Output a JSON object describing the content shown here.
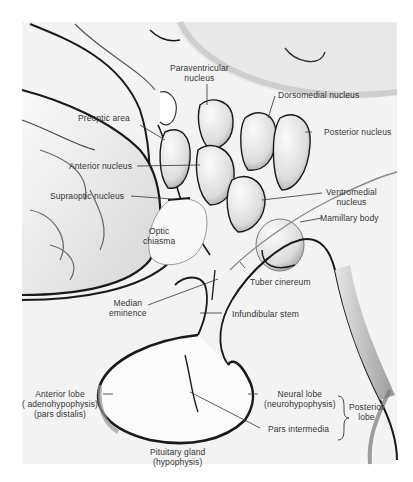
{
  "diagram": {
    "labels": {
      "paraventricular_1": "Paraventricular",
      "paraventricular_2": "nucleus",
      "dorsomedial": "Dorsomedial nucleus",
      "preoptic": "Preoptic area",
      "posterior_nucleus": "Posterior nucleus",
      "anterior_nucleus": "Anterior nucleus",
      "supraoptic": "Supraoptic nucleus",
      "ventromedial_1": "Ventromedial",
      "ventromedial_2": "nucleus",
      "mamillary": "Mamillary body",
      "optic_1": "Optic",
      "optic_2": "chiasma",
      "tuber": "Tuber cinereum",
      "median_1": "Median",
      "median_2": "eminence",
      "infundibular": "Infundibular stem",
      "anterior_lobe_1": "Anterior lobe",
      "anterior_lobe_2": "( adenohypophysis)",
      "anterior_lobe_3": "(pars distalis)",
      "neural_lobe_1": "Neural lobe",
      "neural_lobe_2": "(neurohypophysis)",
      "posterior_lobe_1": "Posterior",
      "posterior_lobe_2": "lobe",
      "pars_intermedia": "Pars intermedia",
      "pituitary_1": "Pituitary gland",
      "pituitary_2": "(hypophysis)"
    },
    "colors": {
      "ink": "#1a1a1a",
      "shade": "#8a8a8a",
      "paper": "#ffffff",
      "panel": "#f2f2f2"
    }
  }
}
